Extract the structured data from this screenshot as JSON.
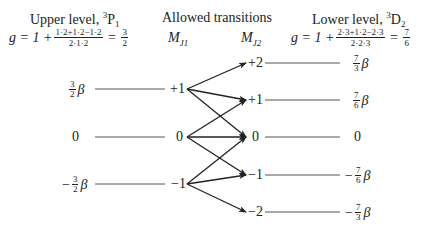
{
  "upper": {
    "title_prefix": "Upper level, ",
    "term_sup": "3",
    "term_letter": "P",
    "term_sub": "1",
    "g_prefix": "g = 1 + ",
    "g_num": "1·2+1·2−1·2",
    "g_den": "2·1·2",
    "g_eq": " = ",
    "g_result_num": "3",
    "g_result_den": "2"
  },
  "transitions": {
    "title": "Allowed transitions",
    "mj1_label": "M",
    "mj1_sub": "J1",
    "mj2_label": "M",
    "mj2_sub": "J2"
  },
  "lower": {
    "title_prefix": "Lower level, ",
    "term_sup": "3",
    "term_letter": "D",
    "term_sub": "2",
    "g_prefix": "g = 1 + ",
    "g_num": "2·3+1·2−2·3",
    "g_den": "2·2·3",
    "g_eq": " = ",
    "g_result_num": "7",
    "g_result_den": "6"
  },
  "upper_levels": [
    {
      "m": "+1",
      "energy_sign": "",
      "energy_num": "3",
      "energy_den": "2",
      "energy_suffix": "β",
      "y": 89
    },
    {
      "m": "0",
      "energy_plain": "0",
      "y": 137
    },
    {
      "m": "−1",
      "energy_sign": "−",
      "energy_num": "3",
      "energy_den": "2",
      "energy_suffix": "β",
      "y": 184
    }
  ],
  "lower_levels": [
    {
      "m": "+2",
      "energy_sign": "",
      "energy_num": "7",
      "energy_den": "3",
      "energy_suffix": "β",
      "y": 63
    },
    {
      "m": "+1",
      "energy_sign": "",
      "energy_num": "7",
      "energy_den": "6",
      "energy_suffix": "β",
      "y": 100
    },
    {
      "m": "0",
      "energy_plain": "0",
      "y": 137
    },
    {
      "m": "−1",
      "energy_sign": "−",
      "energy_num": "7",
      "energy_den": "6",
      "energy_suffix": "β",
      "y": 175
    },
    {
      "m": "−2",
      "energy_sign": "−",
      "energy_num": "7",
      "energy_den": "3",
      "energy_suffix": "β",
      "y": 212
    }
  ],
  "arrows": [
    {
      "from": "+1",
      "to": "+2"
    },
    {
      "from": "+1",
      "to": "+1"
    },
    {
      "from": "+1",
      "to": "0"
    },
    {
      "from": "0",
      "to": "+1"
    },
    {
      "from": "0",
      "to": "0"
    },
    {
      "from": "0",
      "to": "−1"
    },
    {
      "from": "−1",
      "to": "0"
    },
    {
      "from": "−1",
      "to": "−1"
    },
    {
      "from": "−1",
      "to": "−2"
    }
  ],
  "colors": {
    "line": "#222222",
    "level_line": "#555555",
    "text": "#222222"
  }
}
